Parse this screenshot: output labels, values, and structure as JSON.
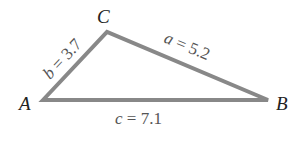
{
  "diagram": {
    "type": "triangle",
    "stroke_color": "#888888",
    "vertices": [
      {
        "name": "A",
        "x": 43,
        "y": 100
      },
      {
        "name": "B",
        "x": 268,
        "y": 100
      },
      {
        "name": "C",
        "x": 107,
        "y": 32
      }
    ],
    "vertex_labels": {
      "A": "A",
      "B": "B",
      "C": "C"
    },
    "sides": {
      "a": {
        "var": "a",
        "eq": " = ",
        "value": "5.2",
        "between": "C-B"
      },
      "b": {
        "var": "b",
        "eq": " = ",
        "value": "3.7",
        "between": "A-C"
      },
      "c": {
        "var": "c",
        "eq": " = ",
        "value": "7.1",
        "between": "A-B"
      }
    }
  }
}
